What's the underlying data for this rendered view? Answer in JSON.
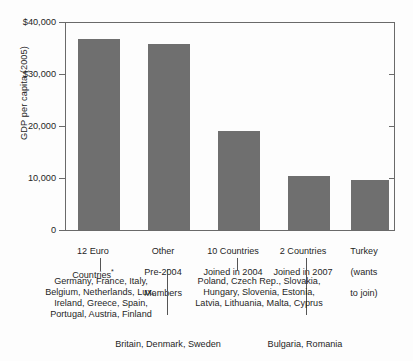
{
  "chart_data": {
    "type": "bar",
    "title": "",
    "xlabel": "",
    "ylabel": "GDP per capita (2005)",
    "ylim": [
      0,
      40000
    ],
    "grid": false,
    "legend": "none",
    "ytick_labels": [
      "$40,000",
      "$30,000",
      "20,000",
      "10,000",
      "0"
    ],
    "ytick_values": [
      40000,
      30000,
      20000,
      10000,
      0
    ],
    "categories": [
      "12 Euro Countries*",
      "Other Pre-2004 Members",
      "10 Countries Joined in 2004",
      "2 Countries Joined in 2007",
      "Turkey (wants to join)"
    ],
    "values": [
      36800,
      35800,
      19000,
      10400,
      9600
    ],
    "annotations": [
      "Germany, France, Italy, Belgium, Netherlands, Lux., Ireland, Greece, Spain, Portugal, Austria, Finland",
      "Britain, Denmark, Sweden",
      "Poland, Czech Rep., Slovakia, Hungary, Slovenia, Estonia, Latvia, Lithuania, Malta, Cyprus",
      "Bulgaria, Romania"
    ]
  },
  "colors": {
    "bar_fill": "#6f6f6f",
    "axis": "#6a6a6a",
    "text": "#1f1f1f",
    "background": "#fdfdfd"
  },
  "axis": {
    "y_title": "GDP per capita (2005)",
    "ticks": [
      {
        "label": "$40,000"
      },
      {
        "label": "$30,000"
      },
      {
        "label": "20,000"
      },
      {
        "label": "10,000"
      },
      {
        "label": "0"
      }
    ]
  },
  "categories": [
    {
      "line1": "12 Euro",
      "line2": "Countries",
      "asterisk": "*",
      "line3": ""
    },
    {
      "line1": "Other",
      "line2": "Pre-2004",
      "line3": "Members"
    },
    {
      "line1": "10 Countries",
      "line2": "Joined in 2004",
      "line3": ""
    },
    {
      "line1": "2 Countries",
      "line2": "Joined in 2007",
      "line3": ""
    },
    {
      "line1": "Turkey",
      "line2": "(wants",
      "line3": "to join)"
    }
  ],
  "notes": {
    "euro12": "Germany, France, Italy,\nBelgium, Netherlands, Lux.,\nIreland, Greece, Spain,\nPortugal, Austria, Finland",
    "pre2004": "Britain, Denmark, Sweden",
    "joined2004": "Poland, Czech Rep., Slovakia,\nHungary, Slovenia, Estonia,\nLatvia, Lithuania, Malta, Cyprus",
    "joined2007": "Bulgaria, Romania"
  }
}
